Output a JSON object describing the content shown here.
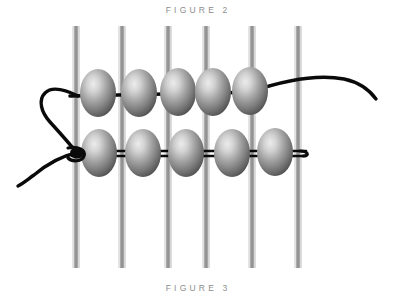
{
  "figure": {
    "title_top": "FIGURE 2",
    "title_bottom": "FIGURE 3",
    "caption_color": "#8d8d8d",
    "background_color": "#ffffff"
  },
  "diagram": {
    "type": "technical-illustration",
    "colors": {
      "rod_light": "#d8d8d8",
      "rod_mid": "#8f8f8f",
      "rod_dark": "#7a7a7a",
      "bead_highlight": "#e8e8e8",
      "bead_mid": "#9a9a9a",
      "bead_dark": "#4a4a4a",
      "wire": "#0a0a0a"
    },
    "rods": {
      "count": 6,
      "x_positions": [
        76,
        122,
        168,
        206,
        252,
        298
      ],
      "y_top": 26,
      "y_bottom": 268,
      "width": 7
    },
    "upper_strand": {
      "bead_count": 5,
      "bead_centers_x": [
        98,
        139,
        178,
        213,
        250
      ],
      "bead_center_y": 93,
      "bead_width": 36,
      "bead_height": 48,
      "wire_y": 95
    },
    "lower_strand": {
      "bead_count": 5,
      "bead_centers_x": [
        99,
        143,
        186,
        232,
        275
      ],
      "bead_center_y": 153,
      "bead_width": 36,
      "bead_height": 48,
      "wire_y": 153
    },
    "knot": {
      "x": 76,
      "y": 152
    },
    "wire_end_right_upper_x": 376,
    "wire_end_right_lower_x": 308,
    "wire_tail_end": {
      "x": 18,
      "y": 186
    }
  }
}
